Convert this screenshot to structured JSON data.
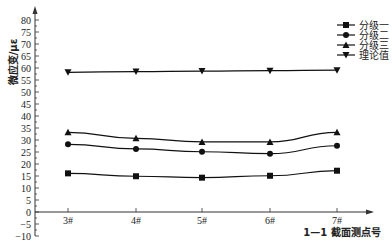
{
  "chart_data": {
    "type": "line",
    "title": "",
    "xlabel": "1—1 截面测点号",
    "ylabel": "微应变/με",
    "categories": [
      "3#",
      "4#",
      "5#",
      "6#",
      "7#"
    ],
    "ylim": [
      -10,
      80
    ],
    "yticks": [
      -10,
      -5,
      0,
      5,
      10,
      15,
      20,
      25,
      30,
      35,
      40,
      45,
      50,
      55,
      60,
      65,
      70,
      75,
      80
    ],
    "grid": false,
    "legend_position": "upper right",
    "series": [
      {
        "name": "分级一",
        "marker": "square",
        "values": [
          16.1,
          14.9,
          14.3,
          15.1,
          17.2
        ]
      },
      {
        "name": "分级二",
        "marker": "circle",
        "values": [
          28.2,
          26.3,
          25.1,
          24.3,
          27.6
        ]
      },
      {
        "name": "分级三",
        "marker": "triangle-up",
        "values": [
          33.2,
          30.7,
          29.2,
          29.2,
          33.2
        ]
      },
      {
        "name": "理论值",
        "marker": "triangle-down",
        "values": [
          58.2,
          58.5,
          58.7,
          58.9,
          59.1
        ]
      }
    ]
  },
  "colors": {
    "line": "#111111",
    "axis": "#333333"
  }
}
